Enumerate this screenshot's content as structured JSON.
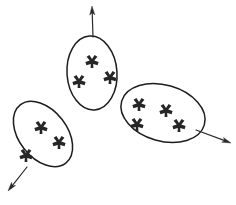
{
  "figure": {
    "title": "",
    "background_color": "#ffffff",
    "stroke_color": "#1d1d1d",
    "point_color": "#262626",
    "arrow_color": "#2a2a2a",
    "width": 236,
    "height": 205
  },
  "chart_data": {
    "type": "scatter",
    "title": "",
    "xlabel": "",
    "ylabel": "",
    "grid": false,
    "legend": false,
    "clusters": [
      {
        "name": "top-cluster",
        "label": "",
        "point_count": 3,
        "ellipse": {
          "cx": 92,
          "cy": 73,
          "rx": 25,
          "ry": 37,
          "rotation": -4
        },
        "points": [
          {
            "x": 92,
            "y": 61
          },
          {
            "x": 79,
            "y": 81
          },
          {
            "x": 110,
            "y": 77
          }
        ],
        "arrow": {
          "direction": "up",
          "from": {
            "x": 93,
            "y": 37
          },
          "to": {
            "x": 92,
            "y": 6
          }
        }
      },
      {
        "name": "left-cluster",
        "label": "",
        "point_count": 3,
        "ellipse": {
          "cx": 43,
          "cy": 134,
          "rx": 24,
          "ry": 37,
          "rotation": -38
        },
        "points": [
          {
            "x": 41,
            "y": 127
          },
          {
            "x": 59,
            "y": 142
          },
          {
            "x": 26,
            "y": 155
          }
        ],
        "arrow": {
          "direction": "down-left",
          "from": {
            "x": 27,
            "y": 167
          },
          "to": {
            "x": 8,
            "y": 191
          }
        }
      },
      {
        "name": "right-cluster",
        "label": "",
        "point_count": 4,
        "ellipse": {
          "cx": 163,
          "cy": 113,
          "rx": 43,
          "ry": 28,
          "rotation": 16
        },
        "points": [
          {
            "x": 139,
            "y": 104
          },
          {
            "x": 166,
            "y": 110
          },
          {
            "x": 137,
            "y": 124
          },
          {
            "x": 179,
            "y": 125
          }
        ],
        "arrow": {
          "direction": "right-down",
          "from": {
            "x": 196,
            "y": 130
          },
          "to": {
            "x": 231,
            "y": 143
          }
        }
      }
    ]
  }
}
